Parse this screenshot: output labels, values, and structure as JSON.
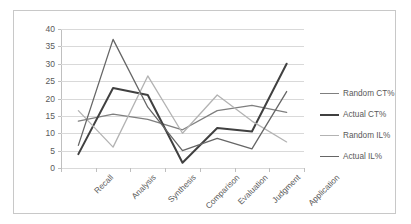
{
  "chart_data": {
    "type": "line",
    "title": "",
    "xlabel": "",
    "ylabel": "",
    "ylim": [
      0,
      40
    ],
    "ytick_step": 5,
    "grid": true,
    "legend_position": "right",
    "categories": [
      "Recall",
      "Analysis",
      "Synthesis",
      "Comparison",
      "Evaluation",
      "Judgment",
      "Application"
    ],
    "ytick_labels": [
      "40",
      "35",
      "30",
      "25",
      "20",
      "15",
      "10",
      "5",
      "0"
    ],
    "ytick_values": [
      40,
      35,
      30,
      25,
      20,
      15,
      10,
      5,
      0
    ],
    "series": [
      {
        "name": "Random CT%",
        "color": "#7f7f7f",
        "width": 1.3,
        "values": [
          13.5,
          15.5,
          14.0,
          11.0,
          16.5,
          18.0,
          16.0
        ]
      },
      {
        "name": "Actual CT%",
        "color": "#404040",
        "width": 2.0,
        "values": [
          4.0,
          23.0,
          21.0,
          1.5,
          11.5,
          10.5,
          30.0
        ]
      },
      {
        "name": "Random IL%",
        "color": "#b3b3b3",
        "width": 1.3,
        "values": [
          16.5,
          6.0,
          26.5,
          10.0,
          21.0,
          13.5,
          7.5
        ]
      },
      {
        "name": "Actual IL%",
        "color": "#666666",
        "width": 1.3,
        "values": [
          6.5,
          37.0,
          17.5,
          5.0,
          8.5,
          5.5,
          22.0
        ]
      }
    ]
  },
  "legend": {
    "items": [
      {
        "label": "Random CT%"
      },
      {
        "label": "Actual CT%"
      },
      {
        "label": "Random IL%"
      },
      {
        "label": "Actual IL%"
      }
    ]
  },
  "colors": {
    "grid": "#d9d9d9",
    "axis": "#bfbfbf",
    "text": "#595959",
    "frame": "#c8c8c8",
    "background": "#ffffff"
  }
}
